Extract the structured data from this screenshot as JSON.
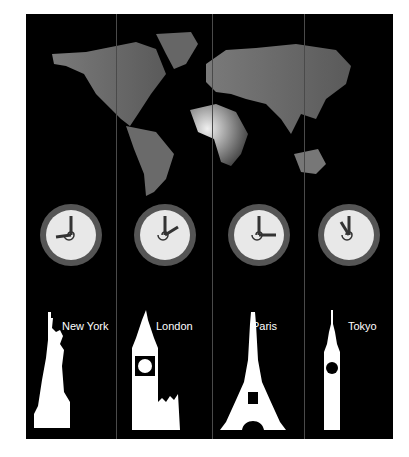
{
  "colors": {
    "background": "#000000",
    "land": "#6e6e6e",
    "clock_face": "#e8e8e8",
    "silhouette": "#ffffff"
  },
  "cities": [
    {
      "name": "New York",
      "landmark": "statue-of-liberty",
      "hour_angle": 270,
      "minute_angle": 0
    },
    {
      "name": "London",
      "landmark": "big-ben",
      "hour_angle": 60,
      "minute_angle": 0
    },
    {
      "name": "Paris",
      "landmark": "eiffel-tower",
      "hour_angle": 90,
      "minute_angle": 0
    },
    {
      "name": "Tokyo",
      "landmark": "tokyo-tower-building",
      "hour_angle": 330,
      "minute_angle": 0
    }
  ]
}
